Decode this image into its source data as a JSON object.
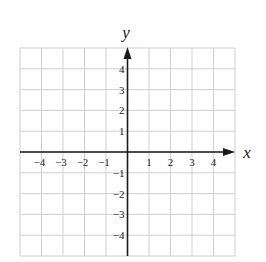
{
  "chart_data": {
    "type": "coordinate-grid",
    "title": "",
    "xlabel": "x",
    "ylabel": "y",
    "xlim": [
      -5,
      5
    ],
    "ylim": [
      -5,
      5
    ],
    "grid": true,
    "grid_step": 1,
    "x_ticks": [
      -4,
      -3,
      -2,
      -1,
      1,
      2,
      3,
      4
    ],
    "y_ticks": [
      4,
      3,
      2,
      1,
      -1,
      -2,
      -3,
      -4
    ],
    "x_tick_labels": [
      "−4",
      "−3",
      "−2",
      "−1",
      "1",
      "2",
      "3",
      "4"
    ],
    "y_tick_labels": [
      "4",
      "3",
      "2",
      "1",
      "−1",
      "−2",
      "−3",
      "−4"
    ],
    "series": []
  },
  "colors": {
    "grid": "#cfcfcf",
    "axis": "#1a1a1a",
    "text": "#222222",
    "background": "#ffffff"
  },
  "axes": {
    "x_name": "x",
    "y_name": "y"
  }
}
